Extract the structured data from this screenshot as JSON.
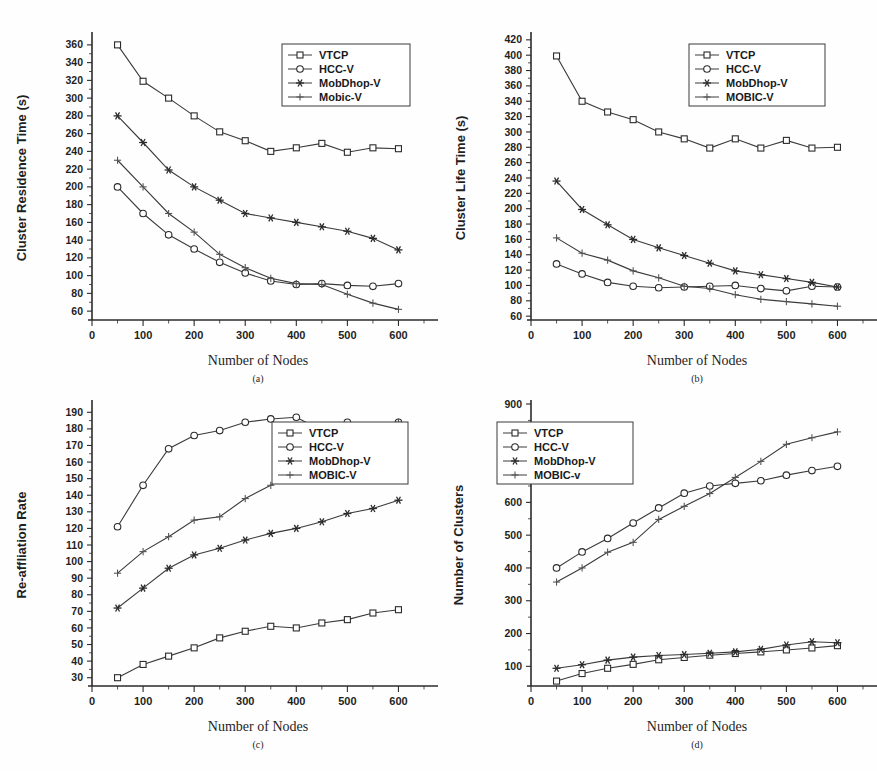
{
  "figure": {
    "background_color": "#fefefe",
    "ink_color": "#2b2b2b",
    "x_axis_label": "Number of Nodes",
    "x_categories": [
      50,
      100,
      150,
      200,
      250,
      300,
      350,
      400,
      450,
      500,
      550,
      600
    ],
    "x_ticks": [
      0,
      100,
      200,
      300,
      400,
      500,
      600
    ],
    "x_range": [
      0,
      650
    ]
  },
  "panels": [
    {
      "id": "a",
      "caption": "(a)",
      "legend_position": "top-right",
      "chart_data": {
        "type": "line",
        "title": "",
        "xlabel": "Number of Nodes",
        "ylabel": "Cluster Residence Time (s)",
        "xlim": [
          0,
          650
        ],
        "ylim": [
          50,
          370
        ],
        "yticks": [
          60,
          80,
          100,
          120,
          140,
          160,
          180,
          200,
          220,
          240,
          260,
          280,
          300,
          320,
          340,
          360
        ],
        "xticks": [
          0,
          100,
          200,
          300,
          400,
          500,
          600
        ],
        "grid": false,
        "legend": [
          "VTCP",
          "HCC-V",
          "MobDhop-V",
          "Mobic-V"
        ],
        "x": [
          50,
          100,
          150,
          200,
          250,
          300,
          350,
          400,
          450,
          500,
          550,
          600
        ],
        "series": [
          {
            "name": "VTCP",
            "marker": "square",
            "values": [
              360,
              319,
              300,
              280,
              262,
              252,
              240,
              244,
              249,
              239,
              244,
              243
            ]
          },
          {
            "name": "HCC-V",
            "marker": "circle",
            "values": [
              200,
              170,
              146,
              130,
              115,
              103,
              94,
              90,
              91,
              89,
              88,
              91
            ]
          },
          {
            "name": "MobDhop-V",
            "marker": "star",
            "values": [
              280,
              250,
              219,
              200,
              185,
              170,
              165,
              160,
              155,
              150,
              142,
              129
            ]
          },
          {
            "name": "Mobic-V",
            "marker": "plus",
            "values": [
              230,
              200,
              170,
              149,
              124,
              109,
              97,
              91,
              90,
              79,
              69,
              62
            ]
          }
        ]
      }
    },
    {
      "id": "b",
      "caption": "(b)",
      "legend_position": "top-right",
      "chart_data": {
        "type": "line",
        "title": "",
        "xlabel": "Number of Nodes",
        "ylabel": "Cluster Life Time (s)",
        "xlim": [
          0,
          650
        ],
        "ylim": [
          55,
          425
        ],
        "yticks": [
          60,
          80,
          100,
          120,
          140,
          160,
          180,
          200,
          220,
          240,
          260,
          280,
          300,
          320,
          340,
          360,
          380,
          400,
          420
        ],
        "xticks": [
          0,
          100,
          200,
          300,
          400,
          500,
          600
        ],
        "grid": false,
        "legend": [
          "VTCP",
          "HCC-V",
          "MobDhop-V",
          "MOBIC-V"
        ],
        "x": [
          50,
          100,
          150,
          200,
          250,
          300,
          350,
          400,
          450,
          500,
          550,
          600
        ],
        "series": [
          {
            "name": "VTCP",
            "marker": "square",
            "values": [
              399,
              340,
              326,
              316,
              300,
              291,
              279,
              291,
              279,
              289,
              279,
              280
            ]
          },
          {
            "name": "HCC-V",
            "marker": "circle",
            "values": [
              128,
              115,
              104,
              99,
              97,
              98,
              99,
              100,
              96,
              93,
              99,
              98
            ]
          },
          {
            "name": "MobDhop-V",
            "marker": "star",
            "values": [
              236,
              199,
              179,
              160,
              149,
              139,
              129,
              119,
              114,
              109,
              104,
              98
            ]
          },
          {
            "name": "MOBIC-V",
            "marker": "plus",
            "values": [
              162,
              142,
              133,
              119,
              110,
              99,
              96,
              88,
              82,
              79,
              76,
              73
            ]
          }
        ]
      }
    },
    {
      "id": "c",
      "caption": "(c)",
      "legend_position": "mid-right",
      "chart_data": {
        "type": "line",
        "title": "",
        "xlabel": "Number of Nodes",
        "ylabel": "Re-affliation Rate",
        "xlim": [
          0,
          650
        ],
        "ylim": [
          25,
          195
        ],
        "yticks": [
          30,
          40,
          50,
          60,
          70,
          80,
          90,
          100,
          110,
          120,
          130,
          140,
          150,
          160,
          170,
          180,
          190
        ],
        "xticks": [
          0,
          100,
          200,
          300,
          400,
          500,
          600
        ],
        "grid": false,
        "legend": [
          "VTCP",
          "HCC-V",
          "MobDhop-V",
          "MOBIC-V"
        ],
        "x": [
          50,
          100,
          150,
          200,
          250,
          300,
          350,
          400,
          450,
          500,
          550,
          600
        ],
        "series": [
          {
            "name": "VTCP",
            "marker": "square",
            "values": [
              30,
              38,
              43,
              48,
              54,
              58,
              61,
              60,
              63,
              65,
              69,
              71
            ]
          },
          {
            "name": "HCC-V",
            "marker": "circle",
            "values": [
              121,
              146,
              168,
              176,
              179,
              184,
              186,
              187,
              179,
              184,
              179,
              184
            ]
          },
          {
            "name": "MobDhop-V",
            "marker": "star",
            "values": [
              72,
              84,
              96,
              104,
              108,
              113,
              117,
              120,
              124,
              129,
              132,
              137
            ]
          },
          {
            "name": "MOBIC-V",
            "marker": "plus",
            "values": [
              93,
              106,
              115,
              125,
              127,
              138,
              146,
              155,
              164,
              172,
              179,
              184
            ]
          }
        ]
      }
    },
    {
      "id": "d",
      "caption": "(d)",
      "legend_position": "upper-left",
      "chart_data": {
        "type": "line",
        "title": "",
        "xlabel": "Number of Nodes",
        "ylabel": "Number of Clusters",
        "xlim": [
          0,
          650
        ],
        "ylim": [
          40,
          900
        ],
        "yticks": [
          100,
          200,
          300,
          400,
          500,
          600,
          700,
          800,
          900
        ],
        "xticks": [
          0,
          100,
          200,
          300,
          400,
          500,
          600
        ],
        "grid": false,
        "legend": [
          "VTCP",
          "HCC-V",
          "MobDhop-V",
          "MOBIC-v"
        ],
        "x": [
          50,
          100,
          150,
          200,
          250,
          300,
          350,
          400,
          450,
          500,
          550,
          600
        ],
        "series": [
          {
            "name": "VTCP",
            "marker": "square",
            "values": [
              55,
              78,
              94,
              106,
              120,
              127,
              134,
              139,
              144,
              150,
              156,
              163
            ]
          },
          {
            "name": "HCC-V",
            "marker": "circle",
            "values": [
              400,
              449,
              490,
              537,
              583,
              628,
              650,
              658,
              666,
              683,
              697,
              710
            ]
          },
          {
            "name": "MobDhop-V",
            "marker": "star",
            "values": [
              94,
              105,
              119,
              128,
              133,
              136,
              140,
              144,
              152,
              165,
              175,
              172
            ]
          },
          {
            "name": "MOBIC-v",
            "marker": "plus",
            "values": [
              357,
              400,
              448,
              478,
              548,
              588,
              627,
              676,
              725,
              777,
              797,
              815
            ]
          }
        ]
      }
    }
  ]
}
